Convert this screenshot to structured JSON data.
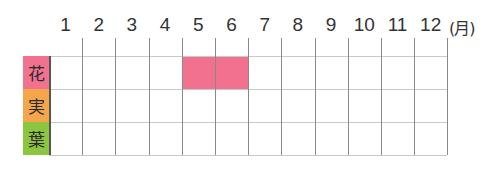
{
  "chart_data": {
    "type": "table",
    "title": "",
    "unit_label": "(月)",
    "months": [
      "1",
      "2",
      "3",
      "4",
      "5",
      "6",
      "7",
      "8",
      "9",
      "10",
      "11",
      "12"
    ],
    "rows": [
      {
        "label": "花",
        "color": "#f2718f",
        "filled_months": [
          5,
          6
        ]
      },
      {
        "label": "実",
        "color": "#f5a64a",
        "filled_months": []
      },
      {
        "label": "葉",
        "color": "#8cc63f",
        "filled_months": []
      }
    ],
    "fill_color": "#f2718f",
    "grid": true
  }
}
